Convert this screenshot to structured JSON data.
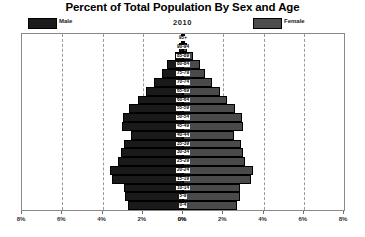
{
  "chart_data": {
    "type": "bar",
    "subtype": "population-pyramid",
    "title": "Percent of Total Population By Sex and Age",
    "subtitle": "2010",
    "xlabel": "",
    "ylabel": "",
    "grid": true,
    "legend_position": "top",
    "legend": [
      {
        "name": "Male",
        "color": "#1a1a1a"
      },
      {
        "name": "Female",
        "color": "#4a4a4a"
      }
    ],
    "categories": [
      "95+",
      "90-94",
      "85-89",
      "80-84",
      "75-79",
      "70-74",
      "65-69",
      "60-64",
      "55-59",
      "50-54",
      "45-49",
      "40-44",
      "35-39",
      "30-34",
      "25-29",
      "20-24",
      "15-19",
      "10-14",
      "5-9",
      "0-4"
    ],
    "series": [
      {
        "name": "Male",
        "color": "#1a1a1a",
        "values": [
          0.05,
          0.18,
          0.42,
          0.78,
          1.05,
          1.45,
          1.85,
          2.25,
          2.7,
          3.0,
          3.05,
          2.6,
          2.95,
          3.1,
          3.25,
          3.65,
          3.55,
          2.95,
          2.9,
          2.75
        ]
      },
      {
        "name": "Female",
        "color": "#4a4a4a",
        "values": [
          0.05,
          0.22,
          0.5,
          0.85,
          1.1,
          1.45,
          1.85,
          2.2,
          2.6,
          2.95,
          3.0,
          2.55,
          2.9,
          3.0,
          3.1,
          3.5,
          3.4,
          2.85,
          2.85,
          2.7
        ]
      }
    ],
    "x_ticks_left": [
      "8%",
      "6%",
      "4%",
      "2%",
      "0%"
    ],
    "x_ticks_right": [
      "0%",
      "2%",
      "4%",
      "6%",
      "8%"
    ],
    "xlim_half": [
      0,
      8
    ],
    "unit": "%"
  },
  "header": {
    "title": "Percent of Total Population By Sex and Age",
    "year": "2010",
    "legend_male": "Male",
    "legend_female": "Female"
  }
}
